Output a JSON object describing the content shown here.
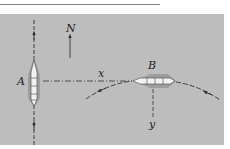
{
  "diagram": {
    "labels": {
      "ship_a": "A",
      "ship_b": "B",
      "north": "N",
      "axis_x": "x",
      "axis_y": "y"
    },
    "colors": {
      "background": "#bdbdbd",
      "line": "#333333",
      "ship_fill": "#f2f2f2"
    }
  }
}
